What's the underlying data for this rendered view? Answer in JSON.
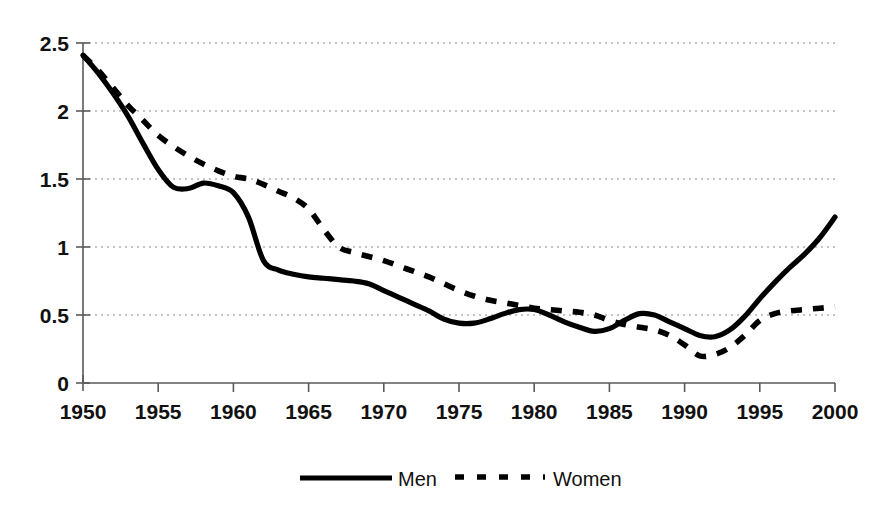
{
  "chart_data": {
    "type": "line",
    "title": "",
    "subtitle": "",
    "xlabel": "",
    "ylabel": "",
    "xlim": [
      1950,
      2000
    ],
    "ylim": [
      0,
      2.5
    ],
    "grid": true,
    "grid_axis": "y",
    "legend_position": "bottom",
    "y_ticks": [
      "0",
      "0.5",
      "1",
      "1.5",
      "2",
      "2.5"
    ],
    "y_tick_values": [
      0,
      0.5,
      1,
      1.5,
      2,
      2.5
    ],
    "x_ticks": [
      "1950",
      "1955",
      "1960",
      "1965",
      "1970",
      "1975",
      "1980",
      "1985",
      "1990",
      "1995",
      "2000"
    ],
    "x_tick_values": [
      1950,
      1955,
      1960,
      1965,
      1970,
      1975,
      1980,
      1985,
      1990,
      1995,
      2000
    ],
    "x": [
      1950,
      1951,
      1952,
      1953,
      1954,
      1955,
      1956,
      1957,
      1958,
      1959,
      1960,
      1961,
      1962,
      1963,
      1964,
      1965,
      1966,
      1967,
      1968,
      1969,
      1970,
      1971,
      1972,
      1973,
      1974,
      1975,
      1976,
      1977,
      1978,
      1979,
      1980,
      1981,
      1982,
      1983,
      1984,
      1985,
      1986,
      1987,
      1988,
      1989,
      1990,
      1991,
      1992,
      1993,
      1994,
      1995,
      1996,
      1997,
      1998,
      1999,
      2000
    ],
    "series": [
      {
        "name": "Men",
        "style": "solid",
        "color": "#000000",
        "values": [
          2.41,
          2.28,
          2.13,
          1.96,
          1.76,
          1.57,
          1.44,
          1.43,
          1.47,
          1.45,
          1.4,
          1.22,
          0.9,
          0.83,
          0.8,
          0.78,
          0.77,
          0.76,
          0.75,
          0.73,
          0.68,
          0.63,
          0.58,
          0.53,
          0.47,
          0.44,
          0.44,
          0.47,
          0.51,
          0.54,
          0.54,
          0.5,
          0.45,
          0.41,
          0.38,
          0.4,
          0.46,
          0.51,
          0.5,
          0.45,
          0.4,
          0.35,
          0.34,
          0.39,
          0.49,
          0.62,
          0.74,
          0.85,
          0.95,
          1.07,
          1.22
        ]
      },
      {
        "name": "Women",
        "style": "dashed",
        "color": "#000000",
        "values": [
          2.41,
          2.3,
          2.17,
          2.04,
          1.93,
          1.82,
          1.74,
          1.67,
          1.61,
          1.56,
          1.52,
          1.5,
          1.46,
          1.41,
          1.36,
          1.28,
          1.13,
          1.0,
          0.96,
          0.93,
          0.9,
          0.86,
          0.82,
          0.78,
          0.73,
          0.68,
          0.64,
          0.61,
          0.59,
          0.57,
          0.55,
          0.54,
          0.53,
          0.52,
          0.5,
          0.46,
          0.43,
          0.41,
          0.39,
          0.35,
          0.28,
          0.2,
          0.21,
          0.26,
          0.35,
          0.46,
          0.51,
          0.53,
          0.54,
          0.55,
          0.56
        ]
      }
    ]
  },
  "legend": {
    "items": [
      {
        "label": "Men",
        "style": "solid"
      },
      {
        "label": "Women",
        "style": "dashed"
      }
    ]
  },
  "colors": {
    "axis": "#5a5a5a",
    "grid": "#8a8a8a",
    "series": "#000000",
    "background": "#ffffff"
  }
}
